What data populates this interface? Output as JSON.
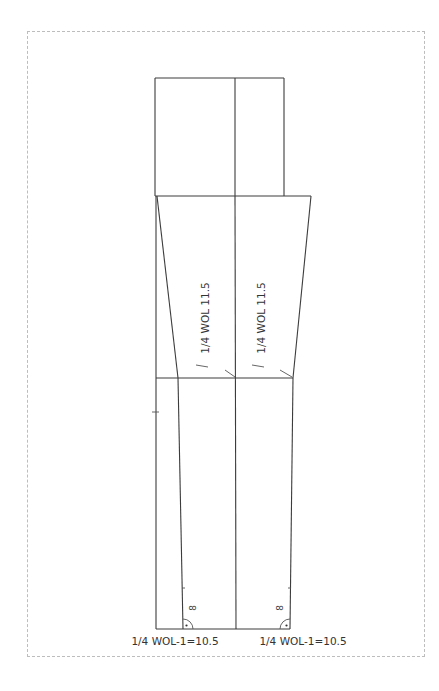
{
  "diagram": {
    "type": "trouser-pattern-draft",
    "panels": [
      {
        "name": "left-panel",
        "vertical_label": "1/4 WOL 11.5",
        "hem_label": "1/4 WOL-1=10.5",
        "hem_mark": "8"
      },
      {
        "name": "right-panel",
        "vertical_label": "1/4 WOL 11.5",
        "hem_label": "1/4 WOL-1=10.5",
        "hem_mark": "8"
      }
    ],
    "colors": {
      "line": "#3c3c3c",
      "frame": "#bdbdbd",
      "background": "#ffffff"
    }
  }
}
